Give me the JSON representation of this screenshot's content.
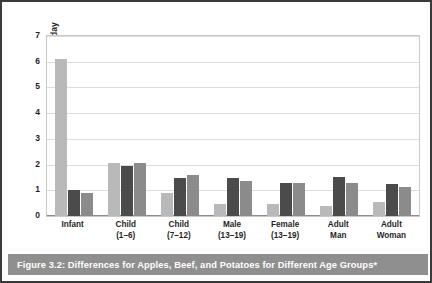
{
  "caption": "Figure 3.2: Differences for Apples, Beef, and Potatoes for Different Age Groups*",
  "colors": {
    "apples": "#b9b9b9",
    "beef": "#4b4b4b",
    "potatoes": "#8b8b8b",
    "caption_bar": "#8f8f8f",
    "gridline": "#dcdcdc",
    "frame_border": "#c9c9c9",
    "outer_border": "#3a3a3a"
  },
  "legend": {
    "position": "top-right",
    "items": [
      {
        "label": "Apples",
        "color": "#bcbcbc"
      },
      {
        "label": "Beef",
        "color": "#414141"
      },
      {
        "label": "Potatoes",
        "color": "#8b8b8b"
      }
    ]
  },
  "chart_data": {
    "type": "bar",
    "title": "",
    "xlabel": "",
    "ylabel": "Grams of Food/kg/day",
    "ylim": [
      0,
      7
    ],
    "yticks": [
      0,
      1,
      2,
      3,
      4,
      5,
      6,
      7
    ],
    "ytick_labels": [
      "0",
      "1",
      "2",
      "3",
      "4",
      "5",
      "6",
      "7"
    ],
    "grid": true,
    "categories": [
      "Infant",
      "Child (1–6)",
      "Child (7–12)",
      "Male (13–19)",
      "Female (13–19)",
      "Adult Man",
      "Adult Woman"
    ],
    "category_lines": [
      [
        "Infant",
        ""
      ],
      [
        "Child",
        "(1–6)"
      ],
      [
        "Child",
        "(7–12)"
      ],
      [
        "Male",
        "(13–19)"
      ],
      [
        "Female",
        "(13–19)"
      ],
      [
        "Adult",
        "Man"
      ],
      [
        "Adult",
        "Woman"
      ]
    ],
    "series": [
      {
        "name": "Apples",
        "color": "#b9b9b9",
        "values": [
          6.15,
          2.12,
          0.93,
          0.5,
          0.51,
          0.44,
          0.57
        ]
      },
      {
        "name": "Beef",
        "color": "#4b4b4b",
        "values": [
          1.05,
          2.0,
          1.52,
          1.53,
          1.31,
          1.54,
          1.3
        ]
      },
      {
        "name": "Potatoes",
        "color": "#8b8b8b",
        "values": [
          0.92,
          2.1,
          1.62,
          1.42,
          1.31,
          1.34,
          1.16
        ]
      }
    ]
  }
}
